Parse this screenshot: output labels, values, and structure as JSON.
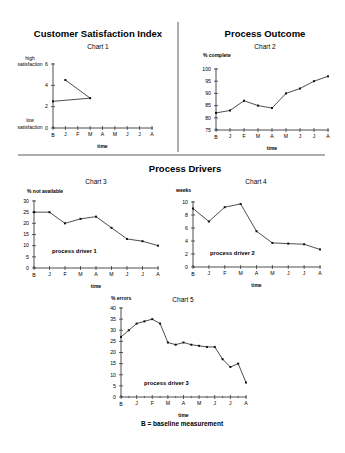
{
  "page": {
    "section_titles": {
      "top_left": "Customer Satisfaction Index",
      "top_right": "Process Outcome",
      "middle": "Process Drivers"
    },
    "footnote": "B = baseline measurement"
  },
  "chart_data": [
    {
      "id": "chart1",
      "type": "line",
      "title": "Customer Satisfaction Index",
      "subtitle": "Chart 1",
      "xlabel": "time",
      "ylabel": "",
      "y_top_label": "high satisfaction",
      "y_bottom_label": "low satisfaction",
      "categories": [
        "B",
        "J",
        "F",
        "M",
        "A",
        "M",
        "J",
        "J",
        "A"
      ],
      "yticks": [
        0,
        2,
        4,
        6
      ],
      "ylim": [
        0,
        6
      ],
      "points": [
        {
          "x": "B",
          "y": 2.5
        },
        {
          "x": "M",
          "y": 2.8
        },
        {
          "x": "J",
          "y": 4.5
        }
      ],
      "grid": false
    },
    {
      "id": "chart2",
      "type": "line",
      "title": "Process Outcome",
      "subtitle": "Chart 2",
      "xlabel": "time",
      "ylabel": "% complete",
      "categories": [
        "B",
        "J",
        "F",
        "M",
        "A",
        "M",
        "J",
        "J",
        "A"
      ],
      "values": [
        82,
        83,
        87,
        85,
        84,
        90,
        92,
        95,
        97
      ],
      "yticks": [
        75,
        80,
        85,
        90,
        95,
        100
      ],
      "ylim": [
        75,
        100
      ],
      "grid": false
    },
    {
      "id": "chart3",
      "type": "line",
      "title": "Chart 3",
      "xlabel": "time",
      "ylabel": "% not available",
      "annotation": "process driver 1",
      "categories": [
        "B",
        "J",
        "F",
        "M",
        "A",
        "M",
        "J",
        "J",
        "A"
      ],
      "values": [
        25,
        25,
        20,
        22,
        23,
        18,
        13,
        12,
        10
      ],
      "yticks": [
        0,
        5,
        10,
        15,
        20,
        25,
        30
      ],
      "ylim": [
        0,
        30
      ],
      "grid": false
    },
    {
      "id": "chart4",
      "type": "line",
      "title": "Chart 4",
      "xlabel": "time",
      "ylabel": "weeks",
      "annotation": "process driver 2",
      "categories": [
        "B",
        "J",
        "F",
        "M",
        "A",
        "M",
        "J",
        "J",
        "A"
      ],
      "values": [
        9,
        7,
        9.2,
        9.7,
        5.5,
        3.7,
        3.6,
        3.5,
        2.7
      ],
      "yticks": [
        0,
        2,
        4,
        6,
        8,
        10
      ],
      "ylim": [
        0,
        10
      ],
      "grid": false
    },
    {
      "id": "chart5",
      "type": "line",
      "title": "Chart 5",
      "xlabel": "time",
      "ylabel": "% errors",
      "annotation": "process driver 3",
      "categories": [
        "B",
        "J",
        "F",
        "M",
        "A",
        "M",
        "J",
        "J",
        "A"
      ],
      "x_note": "semi-monthly measurements (17 points between B and A)",
      "values": [
        27,
        30,
        33,
        34,
        35,
        33,
        24.5,
        23.5,
        24.5,
        23.5,
        23,
        22.5,
        22.5,
        17,
        13.5,
        15,
        6.5
      ],
      "yticks": [
        0,
        5,
        10,
        15,
        20,
        25,
        30,
        35,
        40
      ],
      "ylim": [
        0,
        40
      ],
      "grid": false
    }
  ]
}
